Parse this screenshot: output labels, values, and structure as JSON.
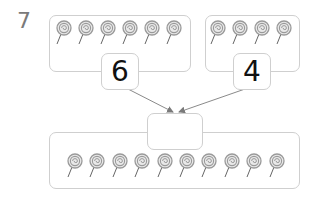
{
  "problem": {
    "number": "7"
  },
  "groups": {
    "left": {
      "count": 6,
      "label": "6"
    },
    "right": {
      "count": 4,
      "label": "4"
    },
    "total": {
      "count": 10,
      "label": ""
    }
  },
  "icons": {
    "item": "lollipop-icon"
  },
  "colors": {
    "border": "#cfcfcf",
    "lollipop": "#9a9a9a",
    "arrow": "#8a8a8a",
    "number": "#111111",
    "problem_number": "#7a7a7a"
  }
}
